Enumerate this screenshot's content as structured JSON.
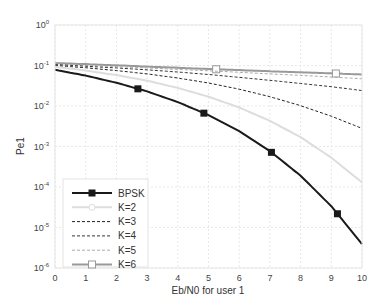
{
  "chart_data": {
    "type": "line",
    "title": "",
    "xlabel": "Eb/N0 for user 1",
    "ylabel": "Pe1",
    "xlim": [
      0,
      10
    ],
    "ylim": [
      1e-06,
      1
    ],
    "yscale": "log",
    "grid": true,
    "legend_position": "lower left",
    "x_ticks": [
      "0",
      "1",
      "2",
      "3",
      "4",
      "5",
      "6",
      "7",
      "8",
      "9",
      "10"
    ],
    "y_ticks": [
      {
        "base": "10",
        "exp": "0"
      },
      {
        "base": "10",
        "exp": "-1"
      },
      {
        "base": "10",
        "exp": "-2"
      },
      {
        "base": "10",
        "exp": "-3"
      },
      {
        "base": "10",
        "exp": "-4"
      },
      {
        "base": "10",
        "exp": "-5"
      },
      {
        "base": "10",
        "exp": "-6"
      }
    ],
    "x": [
      0,
      1,
      2,
      3,
      4,
      5,
      6,
      7,
      8,
      9,
      10
    ],
    "series": [
      {
        "name": "BPSK",
        "style": "solid",
        "color": "#1a1a1a",
        "width": 2,
        "marker": "filled-square",
        "values": [
          0.0786,
          0.0563,
          0.0375,
          0.0229,
          0.0125,
          0.00595,
          0.00239,
          0.00077,
          0.00019,
          3.36e-05,
          3.9e-06
        ],
        "marker_x": [
          2.7,
          4.85,
          7.05,
          9.2
        ]
      },
      {
        "name": "K=2",
        "style": "solid",
        "color": "#dddddd",
        "width": 2,
        "marker": "open-circle",
        "values": [
          0.093,
          0.075,
          0.058,
          0.042,
          0.028,
          0.017,
          0.0092,
          0.0043,
          0.0017,
          0.00053,
          0.00013
        ],
        "marker_x": []
      },
      {
        "name": "K=3",
        "style": "dashed",
        "color": "#222222",
        "width": 1,
        "marker": "none",
        "values": [
          0.1,
          0.088,
          0.075,
          0.062,
          0.049,
          0.037,
          0.026,
          0.017,
          0.0102,
          0.0056,
          0.0028
        ],
        "marker_x": []
      },
      {
        "name": "K=4",
        "style": "dashed",
        "color": "#333333",
        "width": 1,
        "marker": "none",
        "values": [
          0.105,
          0.096,
          0.087,
          0.078,
          0.069,
          0.06,
          0.051,
          0.043,
          0.036,
          0.03,
          0.024
        ],
        "marker_x": []
      },
      {
        "name": "K=5",
        "style": "dashed",
        "color": "#aaaaaa",
        "width": 1,
        "marker": "none",
        "values": [
          0.11,
          0.102,
          0.094,
          0.087,
          0.08,
          0.074,
          0.068,
          0.062,
          0.057,
          0.052,
          0.047
        ],
        "marker_x": []
      },
      {
        "name": "K=6",
        "style": "solid",
        "color": "#999999",
        "width": 2,
        "marker": "open-square",
        "values": [
          0.115,
          0.108,
          0.101,
          0.094,
          0.088,
          0.082,
          0.077,
          0.072,
          0.068,
          0.064,
          0.06
        ],
        "marker_x": [
          5.25,
          9.15
        ]
      }
    ]
  }
}
